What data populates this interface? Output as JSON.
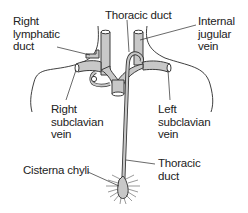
{
  "diagram": {
    "type": "anatomical-illustration",
    "colors": {
      "vein_fill": "#c8c8c8",
      "vein_stroke": "#3a3a3a",
      "outline": "#2a2a2a",
      "text": "#222222",
      "background": "#ffffff"
    },
    "labels": {
      "right_lymphatic_duct": [
        "Right",
        "lymphatic",
        "duct"
      ],
      "thoracic_duct_top": [
        "Thoracic duct"
      ],
      "internal_jugular_vein": [
        "Internal",
        "jugular",
        "vein"
      ],
      "right_subclavian_vein": [
        "Right",
        "subclavian",
        "vein"
      ],
      "left_subclavian_vein": [
        "Left",
        "subclavian",
        "vein"
      ],
      "cisterna_chyli": [
        "Cisterna chyli"
      ],
      "thoracic_duct_bottom": [
        "Thoracic",
        "duct"
      ]
    }
  }
}
